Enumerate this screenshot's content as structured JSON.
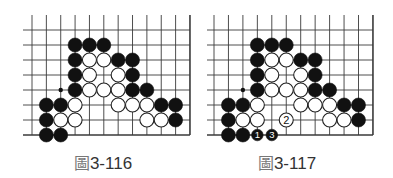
{
  "figures": [
    {
      "id": "fig-3-116",
      "caption_prefix": "圖",
      "caption_number": "3-116",
      "grid": {
        "origin_x": 32,
        "origin_y": 30,
        "dx": 14.36,
        "dy": 15,
        "cols": 12,
        "rows": 8,
        "line_left": 23,
        "line_top": 15,
        "right_edge": true,
        "bottom_edge": true
      },
      "dots": [
        [
          2,
          4
        ]
      ],
      "stones": [
        {
          "c": 3,
          "r": 1,
          "color": "black"
        },
        {
          "c": 4,
          "r": 1,
          "color": "black"
        },
        {
          "c": 5,
          "r": 1,
          "color": "black"
        },
        {
          "c": 3,
          "r": 2,
          "color": "black"
        },
        {
          "c": 4,
          "r": 2,
          "color": "white"
        },
        {
          "c": 5,
          "r": 2,
          "color": "white"
        },
        {
          "c": 6,
          "r": 2,
          "color": "black"
        },
        {
          "c": 7,
          "r": 2,
          "color": "black"
        },
        {
          "c": 3,
          "r": 3,
          "color": "black"
        },
        {
          "c": 4,
          "r": 3,
          "color": "white"
        },
        {
          "c": 6,
          "r": 3,
          "color": "white"
        },
        {
          "c": 7,
          "r": 3,
          "color": "black"
        },
        {
          "c": 3,
          "r": 4,
          "color": "black"
        },
        {
          "c": 4,
          "r": 4,
          "color": "white"
        },
        {
          "c": 5,
          "r": 4,
          "color": "white"
        },
        {
          "c": 6,
          "r": 4,
          "color": "white"
        },
        {
          "c": 7,
          "r": 4,
          "color": "black"
        },
        {
          "c": 8,
          "r": 4,
          "color": "black"
        },
        {
          "c": 1,
          "r": 5,
          "color": "black"
        },
        {
          "c": 2,
          "r": 5,
          "color": "black"
        },
        {
          "c": 3,
          "r": 5,
          "color": "white"
        },
        {
          "c": 6,
          "r": 5,
          "color": "white"
        },
        {
          "c": 7,
          "r": 5,
          "color": "white"
        },
        {
          "c": 8,
          "r": 5,
          "color": "white"
        },
        {
          "c": 9,
          "r": 5,
          "color": "black"
        },
        {
          "c": 10,
          "r": 5,
          "color": "black"
        },
        {
          "c": 1,
          "r": 6,
          "color": "black"
        },
        {
          "c": 2,
          "r": 6,
          "color": "white"
        },
        {
          "c": 3,
          "r": 6,
          "color": "white"
        },
        {
          "c": 8,
          "r": 6,
          "color": "white"
        },
        {
          "c": 9,
          "r": 6,
          "color": "white"
        },
        {
          "c": 10,
          "r": 6,
          "color": "black"
        },
        {
          "c": 1,
          "r": 7,
          "color": "black"
        },
        {
          "c": 2,
          "r": 7,
          "color": "black"
        }
      ]
    },
    {
      "id": "fig-3-117",
      "caption_prefix": "圖",
      "caption_number": "3-117",
      "grid": {
        "origin_x": 214,
        "origin_y": 30,
        "dx": 14.45,
        "dy": 15,
        "cols": 12,
        "rows": 8,
        "line_left": 207,
        "line_top": 15,
        "right_edge": true,
        "bottom_edge": true
      },
      "dots": [
        [
          2,
          4
        ]
      ],
      "stones": [
        {
          "c": 3,
          "r": 1,
          "color": "black"
        },
        {
          "c": 4,
          "r": 1,
          "color": "black"
        },
        {
          "c": 5,
          "r": 1,
          "color": "black"
        },
        {
          "c": 3,
          "r": 2,
          "color": "black"
        },
        {
          "c": 4,
          "r": 2,
          "color": "white"
        },
        {
          "c": 5,
          "r": 2,
          "color": "white"
        },
        {
          "c": 6,
          "r": 2,
          "color": "black"
        },
        {
          "c": 7,
          "r": 2,
          "color": "black"
        },
        {
          "c": 3,
          "r": 3,
          "color": "black"
        },
        {
          "c": 4,
          "r": 3,
          "color": "white"
        },
        {
          "c": 6,
          "r": 3,
          "color": "white"
        },
        {
          "c": 7,
          "r": 3,
          "color": "black"
        },
        {
          "c": 3,
          "r": 4,
          "color": "black"
        },
        {
          "c": 4,
          "r": 4,
          "color": "white"
        },
        {
          "c": 5,
          "r": 4,
          "color": "white"
        },
        {
          "c": 6,
          "r": 4,
          "color": "white"
        },
        {
          "c": 7,
          "r": 4,
          "color": "black"
        },
        {
          "c": 8,
          "r": 4,
          "color": "black"
        },
        {
          "c": 1,
          "r": 5,
          "color": "black"
        },
        {
          "c": 2,
          "r": 5,
          "color": "black"
        },
        {
          "c": 3,
          "r": 5,
          "color": "white"
        },
        {
          "c": 6,
          "r": 5,
          "color": "white"
        },
        {
          "c": 7,
          "r": 5,
          "color": "white"
        },
        {
          "c": 8,
          "r": 5,
          "color": "white"
        },
        {
          "c": 9,
          "r": 5,
          "color": "black"
        },
        {
          "c": 10,
          "r": 5,
          "color": "black"
        },
        {
          "c": 1,
          "r": 6,
          "color": "black"
        },
        {
          "c": 2,
          "r": 6,
          "color": "white"
        },
        {
          "c": 3,
          "r": 6,
          "color": "white"
        },
        {
          "c": 5,
          "r": 6,
          "color": "white",
          "label": "2"
        },
        {
          "c": 8,
          "r": 6,
          "color": "white"
        },
        {
          "c": 9,
          "r": 6,
          "color": "white"
        },
        {
          "c": 10,
          "r": 6,
          "color": "black"
        },
        {
          "c": 1,
          "r": 7,
          "color": "black"
        },
        {
          "c": 2,
          "r": 7,
          "color": "black"
        },
        {
          "c": 3,
          "r": 7,
          "color": "black",
          "label": "1",
          "small": true
        },
        {
          "c": 4,
          "r": 7,
          "color": "black",
          "label": "3",
          "small": true
        }
      ]
    }
  ],
  "colors": {
    "line": "#3a3a3a",
    "black_stone": "#111111",
    "white_stone_fill": "#ffffff",
    "white_stone_stroke": "#222222"
  }
}
